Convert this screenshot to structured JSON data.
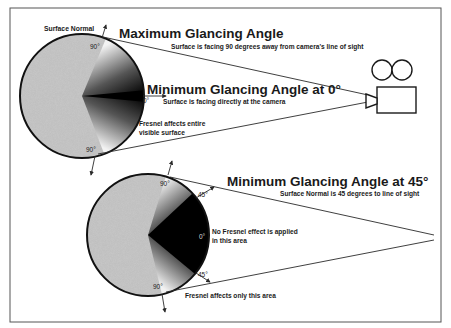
{
  "frame": {
    "border_color": "#555555",
    "background": "#ffffff"
  },
  "top_diagram": {
    "surface_normal_label": "Surface Normal",
    "title_max": "Maximum Glancing Angle",
    "subtitle_max": "Surface is facing 90 degrees away from camera's line of sight",
    "title_min": "Minimum Glancing Angle at 0°",
    "subtitle_min": "Surface is facing directly at the camera",
    "angle_top": "90°",
    "angle_bottom": "90°",
    "angle_center": "0°",
    "fresnel_note_line1": "Fresnel affects entire",
    "fresnel_note_line2": "visible surface"
  },
  "bottom_diagram": {
    "title": "Minimum Glancing Angle at 45°",
    "subtitle": "Surface Normal is 45 degrees to line of sight",
    "angle_top": "90°",
    "angle_top45": "45°",
    "angle_center": "0°",
    "angle_bottom45": "45°",
    "angle_bottom": "90°",
    "no_fresnel_line1": "No Fresnel effect is applied",
    "no_fresnel_line2": "in this area",
    "fresnel_only": "Fresnel affects only this area"
  },
  "camera": {
    "icon": "movie-camera-icon"
  },
  "colors": {
    "sphere_fill": "#bdbdbd",
    "shade_dark": "#000000",
    "shade_light": "#ffffff",
    "line": "#2a2a2a",
    "text": "#1a1a1a"
  }
}
